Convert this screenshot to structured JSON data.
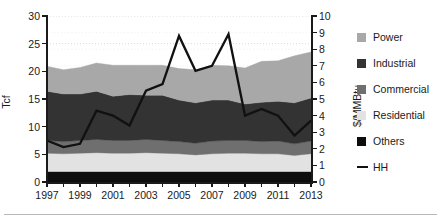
{
  "chart_data": {
    "type": "area",
    "title": "",
    "subtitle": "",
    "xlabel": "",
    "ylabel": "Tcf",
    "ylabel_secondary": "$/MMBtu",
    "x": [
      1997,
      1998,
      1999,
      2000,
      2001,
      2002,
      2003,
      2004,
      2005,
      2006,
      2007,
      2008,
      2009,
      2010,
      2011,
      2012,
      2013
    ],
    "xtick_labels": [
      "1997",
      "1999",
      "2001",
      "2003",
      "2005",
      "2007",
      "2009",
      "2011",
      "2013"
    ],
    "xtick_values": [
      1997,
      1999,
      2001,
      2003,
      2005,
      2007,
      2009,
      2011,
      2013
    ],
    "ylim": [
      0,
      30
    ],
    "ytick_labels": [
      "0",
      "5",
      "10",
      "15",
      "20",
      "25",
      "30"
    ],
    "ytick_values": [
      0,
      5,
      10,
      15,
      20,
      25,
      30
    ],
    "ylim_secondary": [
      0,
      10
    ],
    "ytick_labels_secondary": [
      "0",
      "1",
      "2",
      "3",
      "4",
      "5",
      "6",
      "7",
      "8",
      "9",
      "10"
    ],
    "ytick_values_secondary": [
      0,
      1,
      2,
      3,
      4,
      5,
      6,
      7,
      8,
      9,
      10
    ],
    "grid": true,
    "grid_style": "dotted",
    "legend_position": "right",
    "stack_order_bottom_to_top": [
      "Others",
      "Residential",
      "Commercial",
      "Industrial",
      "Power"
    ],
    "series": [
      {
        "name": "Others",
        "color": "#0d0d0d",
        "values": [
          1.9,
          1.9,
          1.9,
          1.9,
          1.9,
          1.9,
          1.9,
          1.9,
          1.9,
          1.9,
          1.9,
          1.9,
          1.9,
          1.9,
          1.9,
          1.9,
          1.9
        ]
      },
      {
        "name": "Residential",
        "color": "#e2e2e2",
        "values": [
          3.3,
          3.2,
          3.3,
          3.4,
          3.3,
          3.3,
          3.4,
          3.3,
          3.2,
          3.0,
          3.2,
          3.3,
          3.3,
          3.2,
          3.2,
          2.9,
          3.2
        ]
      },
      {
        "name": "Commercial",
        "color": "#6f6f6f",
        "values": [
          2.3,
          2.2,
          2.3,
          2.4,
          2.3,
          2.3,
          2.4,
          2.3,
          2.2,
          2.1,
          2.3,
          2.3,
          2.3,
          2.2,
          2.3,
          2.1,
          2.3
        ]
      },
      {
        "name": "Industrial",
        "color": "#333333",
        "values": [
          8.9,
          8.6,
          8.4,
          8.7,
          8.0,
          8.3,
          8.0,
          8.2,
          7.5,
          7.3,
          7.4,
          7.3,
          6.6,
          7.1,
          7.2,
          7.4,
          7.8
        ]
      },
      {
        "name": "Power",
        "color": "#a8a8a8",
        "values": [
          4.5,
          4.4,
          4.8,
          5.1,
          5.6,
          5.3,
          5.4,
          5.4,
          5.7,
          6.0,
          6.3,
          6.2,
          6.5,
          7.4,
          7.3,
          8.5,
          8.3
        ]
      }
    ],
    "line_series": {
      "name": "HH",
      "color": "#111111",
      "axis": "secondary",
      "unit": "$/MMBtu",
      "values": [
        2.5,
        2.1,
        2.3,
        4.3,
        4.0,
        3.4,
        5.5,
        5.9,
        8.8,
        6.7,
        7.0,
        8.9,
        4.0,
        4.4,
        4.0,
        2.8,
        3.7
      ]
    }
  },
  "legend": {
    "items": [
      {
        "label": "Power",
        "swatch": "#a8a8a8",
        "type": "swatch"
      },
      {
        "label": "Industrial",
        "swatch": "#333333",
        "type": "swatch"
      },
      {
        "label": "Commercial",
        "swatch": "#6f6f6f",
        "type": "swatch"
      },
      {
        "label": "Residential",
        "swatch": "#e2e2e2",
        "type": "swatch"
      },
      {
        "label": "Others",
        "swatch": "#0d0d0d",
        "type": "swatch"
      },
      {
        "label": "HH",
        "swatch": "#111111",
        "type": "line"
      }
    ]
  },
  "axes": {
    "left_title": "Tcf",
    "right_title": "$/MMBtu"
  }
}
